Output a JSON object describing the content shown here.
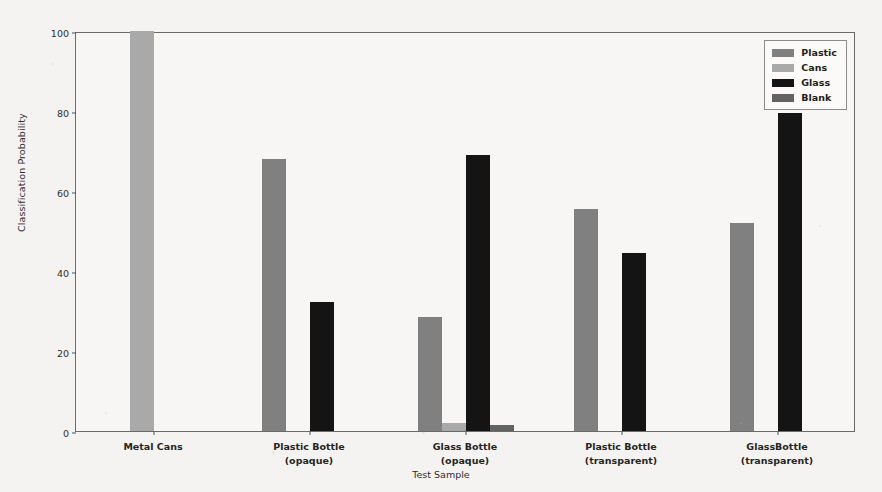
{
  "chart_data": {
    "type": "bar",
    "title": "",
    "xlabel": "Test Sample",
    "ylabel": "Classification Probability",
    "ylim": [
      0,
      100
    ],
    "yticks": [
      0,
      20,
      40,
      60,
      80,
      100
    ],
    "grid": false,
    "legend_position": "upper right",
    "categories": [
      "Metal Cans",
      "Plastic Bottle\n(opaque)",
      "Glass Bottle\n(opaque)",
      "Plastic Bottle\n(transparent)",
      "GlassBottle\n(transparent)"
    ],
    "category_lines": [
      {
        "line1": "Metal Cans",
        "line2": ""
      },
      {
        "line1": "Plastic Bottle",
        "line2": "(opaque)"
      },
      {
        "line1": "Glass Bottle",
        "line2": "(opaque)"
      },
      {
        "line1": "Plastic Bottle",
        "line2": "(transparent)"
      },
      {
        "line1": "GlassBottle",
        "line2": "(transparent)"
      }
    ],
    "series": [
      {
        "name": "Plastic",
        "color": "#808080",
        "values": [
          0,
          68,
          28.5,
          55.5,
          52.0
        ]
      },
      {
        "name": "Cans",
        "color": "#a9a9a9",
        "values": [
          100,
          0,
          2.0,
          0,
          0
        ]
      },
      {
        "name": "Glass",
        "color": "#141414",
        "values": [
          0,
          32.2,
          69.0,
          44.5,
          79.5
        ]
      },
      {
        "name": "Blank",
        "color": "#636363",
        "values": [
          0,
          0,
          1.5,
          0,
          0
        ]
      }
    ]
  },
  "legend": {
    "items": [
      {
        "label": "Plastic",
        "color": "#808080"
      },
      {
        "label": "Cans",
        "color": "#a9a9a9"
      },
      {
        "label": "Glass",
        "color": "#141414"
      },
      {
        "label": "Blank",
        "color": "#636363"
      }
    ]
  },
  "axes": {
    "y_title": "Classification Probability",
    "x_title": "Test Sample",
    "y_ticks": [
      "0",
      "20",
      "40",
      "60",
      "80",
      "100"
    ]
  },
  "colors": {
    "page_background": "#f4f3f1",
    "plot_background": "#f7f6f4",
    "axis": "#6d6b68",
    "text": "#26251f"
  }
}
